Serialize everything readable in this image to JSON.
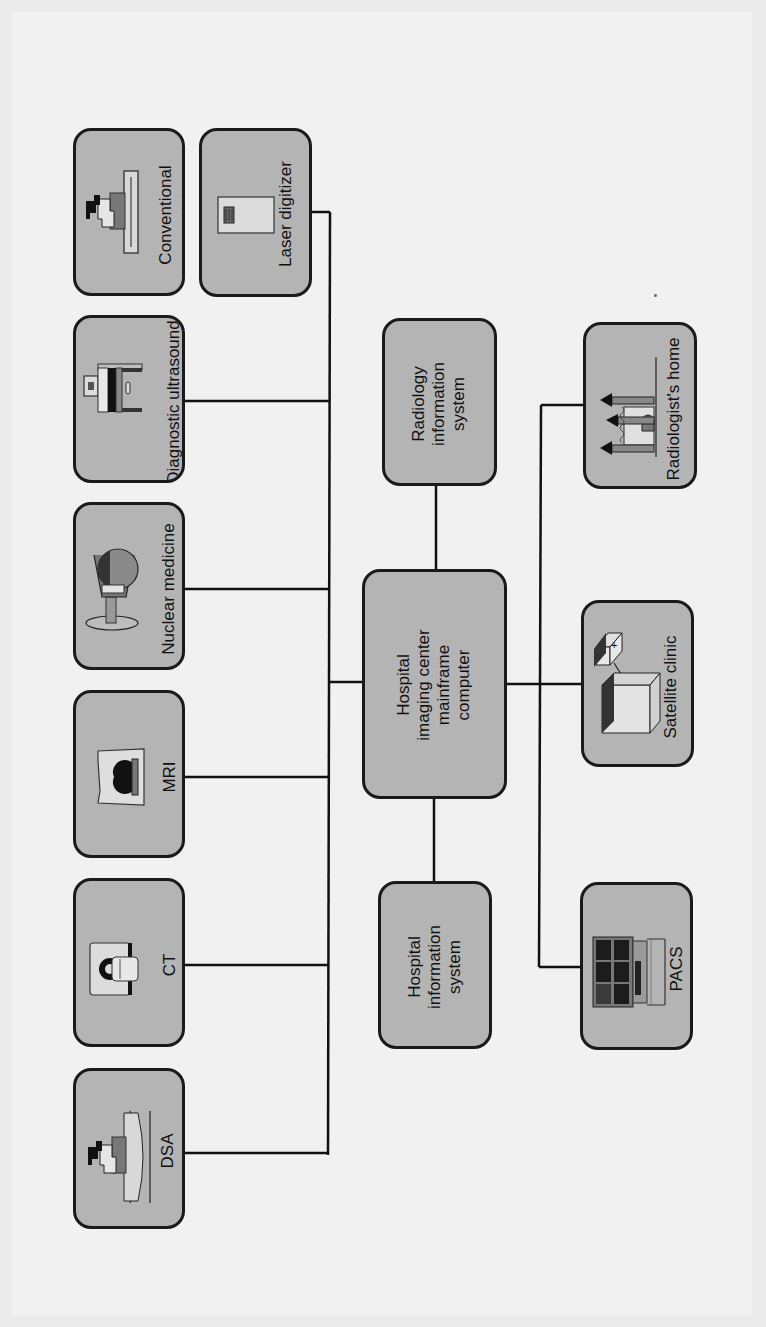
{
  "diagram": {
    "type": "network-topology",
    "orientation": "rotated-90-ccw",
    "colors": {
      "page_background": "#f1f1f1",
      "node_fill": "#b4b4b4",
      "node_border": "#1a1a1a",
      "wire": "#111111"
    },
    "hub": {
      "label": "Hospital\nimaging center\nmainframe\ncomputer"
    },
    "modalities": [
      {
        "id": "conventional-xray",
        "label": "Conventional\nx-ray",
        "icon": "xray-machine-icon"
      },
      {
        "id": "diagnostic-ultrasound",
        "label": "Diagnostic ultrasound",
        "icon": "ultrasound-machine-icon"
      },
      {
        "id": "nuclear-medicine",
        "label": "Nuclear medicine",
        "icon": "gamma-camera-icon"
      },
      {
        "id": "mri",
        "label": "MRI",
        "icon": "mri-scanner-icon"
      },
      {
        "id": "ct",
        "label": "CT",
        "icon": "ct-scanner-icon"
      },
      {
        "id": "dsa",
        "label": "DSA",
        "icon": "dsa-machine-icon"
      }
    ],
    "digitizer": {
      "id": "laser-digitizer",
      "label": "Laser digitizer",
      "icon": "film-digitizer-icon"
    },
    "information_systems": [
      {
        "id": "radiology-information-system",
        "label": "Radiology\ninformation\nsystem"
      },
      {
        "id": "hospital-information-system",
        "label": "Hospital\ninformation\nsystem"
      }
    ],
    "remote_sites": [
      {
        "id": "radiologists-home",
        "label": "Radiologist's home",
        "icon": "house-icon"
      },
      {
        "id": "satellite-clinic",
        "label": "Satellite clinic",
        "icon": "clinic-buildings-icon"
      },
      {
        "id": "pacs",
        "label": "PACS",
        "icon": "pacs-workstation-icon"
      }
    ],
    "connections": [
      [
        "conventional-xray",
        "modality-bus"
      ],
      [
        "diagnostic-ultrasound",
        "modality-bus"
      ],
      [
        "nuclear-medicine",
        "modality-bus"
      ],
      [
        "mri",
        "modality-bus"
      ],
      [
        "ct",
        "modality-bus"
      ],
      [
        "dsa",
        "modality-bus"
      ],
      [
        "laser-digitizer",
        "modality-bus"
      ],
      [
        "modality-bus",
        "hub"
      ],
      [
        "radiology-information-system",
        "hub"
      ],
      [
        "hospital-information-system",
        "hub"
      ],
      [
        "hub",
        "remote-bus"
      ],
      [
        "remote-bus",
        "radiologists-home"
      ],
      [
        "remote-bus",
        "satellite-clinic"
      ],
      [
        "remote-bus",
        "pacs"
      ]
    ]
  }
}
